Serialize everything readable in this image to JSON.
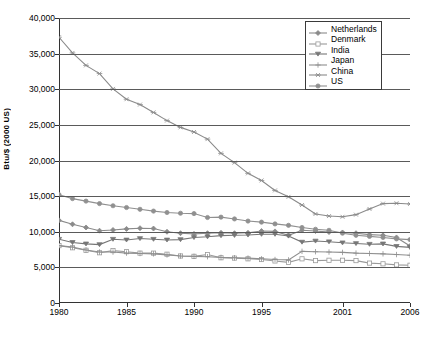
{
  "chart_data": {
    "type": "line",
    "title": "",
    "xlabel": "",
    "ylabel": "Btu/$ (2000 US)",
    "xlim": [
      1980,
      2006
    ],
    "ylim": [
      0,
      40000
    ],
    "yticks": [
      0,
      5000,
      10000,
      15000,
      20000,
      25000,
      30000,
      35000,
      40000
    ],
    "ytick_labels": [
      "0",
      "5,000",
      "10,000",
      "15,000",
      "20,000",
      "25,000",
      "30,000",
      "35,000",
      "40,000"
    ],
    "xticks": [
      1980,
      1985,
      1990,
      1995,
      2001,
      2006
    ],
    "xtick_labels": [
      "1980",
      "1985",
      "1990",
      "1995",
      "2001",
      "2006"
    ],
    "grid": "horizontal",
    "legend_position": "top-right",
    "x": [
      1980,
      1981,
      1982,
      1983,
      1984,
      1985,
      1986,
      1987,
      1988,
      1989,
      1990,
      1991,
      1992,
      1993,
      1994,
      1995,
      1996,
      1997,
      1998,
      1999,
      2000,
      2001,
      2002,
      2003,
      2004,
      2005,
      2006
    ],
    "series": [
      {
        "name": "Netherlands",
        "marker": "diamond",
        "color": "#8a8a8a",
        "values": [
          11600,
          11050,
          10600,
          10150,
          10250,
          10400,
          10500,
          10450,
          10000,
          9800,
          9700,
          9800,
          9850,
          9800,
          9850,
          10100,
          10050,
          9500,
          10200,
          10100,
          9950,
          9900,
          9800,
          9600,
          9500,
          9200,
          8000
        ]
      },
      {
        "name": "Denmark",
        "marker": "square",
        "color": "#9a9a9a",
        "values": [
          8050,
          7750,
          7400,
          7050,
          7350,
          7200,
          7000,
          7000,
          6850,
          6600,
          6550,
          6800,
          6350,
          6300,
          6200,
          6100,
          5900,
          5700,
          6200,
          5950,
          6000,
          6000,
          5950,
          5600,
          5500,
          5350,
          5300
        ]
      },
      {
        "name": "India",
        "marker": "triangle",
        "color": "#777777",
        "values": [
          8950,
          8500,
          8300,
          8200,
          8950,
          8850,
          9050,
          8950,
          8850,
          8900,
          9200,
          9300,
          9450,
          9500,
          9550,
          9650,
          9650,
          9400,
          8550,
          8700,
          8600,
          8450,
          8350,
          8250,
          8300,
          7950,
          7800
        ]
      },
      {
        "name": "Japan",
        "marker": "plus",
        "color": "#8f8f8f",
        "values": [
          8050,
          7850,
          7450,
          7150,
          7150,
          7000,
          6950,
          6900,
          6750,
          6600,
          6550,
          6500,
          6400,
          6350,
          6300,
          6200,
          6100,
          6050,
          7250,
          7200,
          7150,
          7100,
          7000,
          6950,
          6900,
          6800,
          6700
        ]
      },
      {
        "name": "China",
        "marker": "star",
        "color": "#8a8a8a",
        "values": [
          37300,
          35100,
          33350,
          32200,
          30050,
          28600,
          27850,
          26750,
          25600,
          24650,
          24000,
          23000,
          21000,
          19700,
          18200,
          17200,
          15800,
          14900,
          13750,
          12500,
          12200,
          12100,
          12400,
          13200,
          13950,
          14000,
          13900
        ]
      },
      {
        "name": "US",
        "marker": "circle",
        "color": "#909090",
        "values": [
          15200,
          14650,
          14300,
          13950,
          13650,
          13400,
          13150,
          12900,
          12700,
          12600,
          12550,
          12000,
          12050,
          11800,
          11500,
          11350,
          11100,
          10900,
          10600,
          10350,
          10200,
          9800,
          9500,
          9350,
          9200,
          9000,
          8900
        ]
      }
    ]
  },
  "legend": {
    "items": [
      "Netherlands",
      "Denmark",
      "India",
      "Japan",
      "China",
      "US"
    ]
  }
}
